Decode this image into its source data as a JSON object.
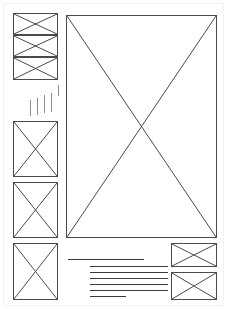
{
  "document": {
    "title": "Page Layout Wireframe",
    "type": "wireframe",
    "canvas": {
      "width": 227,
      "height": 309,
      "background": "#ffffff"
    },
    "stroke_color": "#4a4a4a",
    "rule_color": "#3c3c3c",
    "tick_color": "#8c8c8c"
  },
  "regions": {
    "sidebar_stack": {
      "label": "Stacked image placeholders",
      "x": 13,
      "y": 13,
      "width": 45,
      "height": 67,
      "cells": [
        {
          "label": "image-placeholder-1",
          "x": 13,
          "y": 13,
          "width": 45,
          "height": 22
        },
        {
          "label": "image-placeholder-2",
          "x": 13,
          "y": 35,
          "width": 45,
          "height": 22
        },
        {
          "label": "image-placeholder-3",
          "x": 13,
          "y": 57,
          "width": 45,
          "height": 23
        }
      ]
    },
    "tick_marks": {
      "label": "Short vertical caption marks",
      "marks": [
        {
          "x": 30,
          "y": 100,
          "height": 16
        },
        {
          "x": 37,
          "y": 98,
          "height": 17
        },
        {
          "x": 44,
          "y": 95,
          "height": 18
        },
        {
          "x": 51,
          "y": 93,
          "height": 19
        },
        {
          "x": 58,
          "y": 85,
          "height": 11
        }
      ]
    },
    "left_column_boxes": [
      {
        "label": "image-placeholder-4",
        "x": 13,
        "y": 121,
        "width": 45,
        "height": 56
      },
      {
        "label": "image-placeholder-5",
        "x": 13,
        "y": 182,
        "width": 45,
        "height": 56
      },
      {
        "label": "image-placeholder-6",
        "x": 13,
        "y": 243,
        "width": 45,
        "height": 57
      }
    ],
    "hero_box": {
      "label": "hero-image-placeholder",
      "x": 66,
      "y": 15,
      "width": 151,
      "height": 223
    },
    "bottom_right_boxes": [
      {
        "label": "image-placeholder-7",
        "x": 171,
        "y": 243,
        "width": 46,
        "height": 24
      },
      {
        "label": "image-placeholder-8",
        "x": 171,
        "y": 272,
        "width": 46,
        "height": 28
      }
    ],
    "text_block": {
      "label": "Body copy placeholder rules",
      "heading_rule": {
        "x": 68,
        "y": 259,
        "width": 76
      },
      "body_rules": [
        {
          "x": 90,
          "y": 266,
          "width": 78
        },
        {
          "x": 90,
          "y": 272,
          "width": 78
        },
        {
          "x": 90,
          "y": 278,
          "width": 78
        },
        {
          "x": 90,
          "y": 284,
          "width": 78
        },
        {
          "x": 90,
          "y": 290,
          "width": 78
        },
        {
          "x": 90,
          "y": 296,
          "width": 36
        }
      ]
    }
  }
}
